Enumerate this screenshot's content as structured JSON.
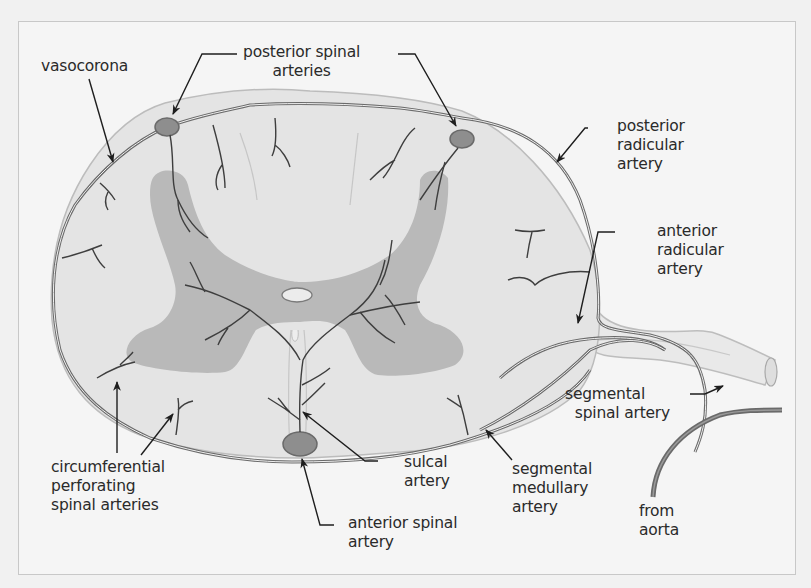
{
  "figure": {
    "colors": {
      "background": "#f1f1f1",
      "frame": "#c8c8c8",
      "white_matter": "#e4e4e4",
      "gray_matter": "#b9b9b9",
      "vessel": "#6a6a6a",
      "vessel_fill": "#8e8e8e",
      "pia": "#bcbcbc",
      "arrow": "#1e1e1e",
      "text": "#2a2a2a"
    }
  },
  "labels": {
    "vasocorona": {
      "lines": [
        "vasocorona"
      ]
    },
    "posterior_spinal_arteries": {
      "lines": [
        "posterior spinal",
        "arteries"
      ]
    },
    "posterior_radicular_artery": {
      "lines": [
        "posterior",
        "radicular",
        "artery"
      ]
    },
    "anterior_radicular_artery": {
      "lines": [
        "anterior",
        "radicular",
        "artery"
      ]
    },
    "segmental_spinal_artery": {
      "lines": [
        "segmental",
        "spinal artery"
      ]
    },
    "circumferential_perforating": {
      "lines": [
        "circumferential",
        "perforating",
        "spinal arteries"
      ]
    },
    "sulcal_artery": {
      "lines": [
        "sulcal",
        "artery"
      ]
    },
    "segmental_medullary_artery": {
      "lines": [
        "segmental",
        "medullary",
        "artery"
      ]
    },
    "anterior_spinal_artery": {
      "lines": [
        "anterior spinal",
        "artery"
      ]
    },
    "from_aorta": {
      "lines": [
        "from",
        "aorta"
      ]
    }
  }
}
